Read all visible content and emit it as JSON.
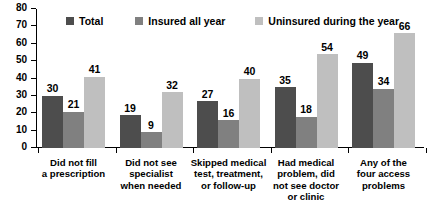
{
  "chart_data": {
    "type": "bar",
    "title": "",
    "subtitle": "",
    "xlabel": "",
    "ylabel": "",
    "ylim": [
      0,
      80
    ],
    "ytick_step": 10,
    "yticks": [
      80,
      70,
      60,
      50,
      40,
      30,
      20,
      10,
      0
    ],
    "grid": false,
    "legend_position": "top",
    "orientation": "vertical",
    "grouped": true,
    "categories": [
      "Did not fill\na prescription",
      "Did not see\nspecialist\nwhen needed",
      "Skipped medical\ntest, treatment,\nor follow-up",
      "Had medical\nproblem, did\nnot see doctor\nor clinic",
      "Any of the\nfour access\nproblems"
    ],
    "category_lines": [
      [
        "Did not fill",
        "a prescription"
      ],
      [
        "Did not see",
        "specialist",
        "when needed"
      ],
      [
        "Skipped medical",
        "test, treatment,",
        "or follow-up"
      ],
      [
        "Had medical",
        "problem, did",
        "not see doctor",
        "or clinic"
      ],
      [
        "Any of the",
        "four access",
        "problems"
      ]
    ],
    "series": [
      {
        "name": "Total",
        "color": "#4d4d4d",
        "values": [
          30,
          19,
          27,
          35,
          49
        ]
      },
      {
        "name": "Insured all year",
        "color": "#808080",
        "values": [
          21,
          9,
          16,
          18,
          34
        ]
      },
      {
        "name": "Uninsured during the year",
        "color": "#bfbfbf",
        "values": [
          41,
          32,
          40,
          54,
          66
        ]
      }
    ]
  },
  "colors": {
    "background": "#ffffff",
    "axis": "#000000",
    "text": "#000000",
    "series_total": "#4d4d4d",
    "series_insured": "#808080",
    "series_uninsured": "#bfbfbf"
  }
}
